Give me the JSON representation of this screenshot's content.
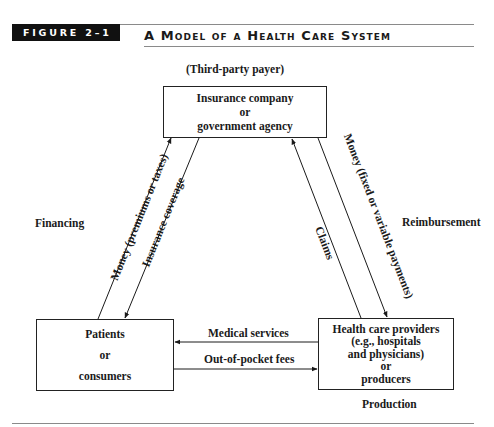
{
  "figure": {
    "label": "FIGURE 2–1",
    "title": "A Model of a Health Care System"
  },
  "nodes": {
    "payer_caption": "(Third-party payer)",
    "insurer": {
      "line1": "Insurance company",
      "line2": "or",
      "line3": "government agency"
    },
    "patients": {
      "line1": "Patients",
      "line2": "or",
      "line3": "consumers"
    },
    "providers": {
      "line1": "Health care providers",
      "line2": "(e.g., hospitals",
      "line3": "and physicians)",
      "line4": "or",
      "line5": "producers"
    },
    "production_caption": "Production"
  },
  "sections": {
    "financing": "Financing",
    "reimbursement": "Reimbursement"
  },
  "flows": {
    "money_premiums": "Money (premiums or taxes)",
    "insurance_coverage": "Insurance coverage",
    "claims": "Claims",
    "money_payments": "Money (fixed or variable payments)",
    "medical_services": "Medical services",
    "out_of_pocket": "Out-of-pocket fees"
  },
  "colors": {
    "ink": "#1a1a1a",
    "rule": "#8a8a8a",
    "label_bg": "#111111"
  }
}
